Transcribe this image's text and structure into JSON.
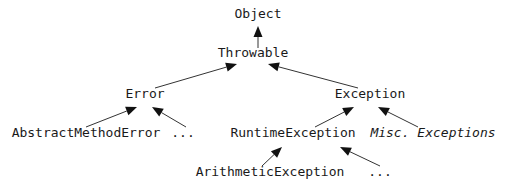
{
  "diagram": {
    "nodes": [
      {
        "id": "object",
        "label": "Object",
        "x": 258,
        "y": 18,
        "italic": false
      },
      {
        "id": "throwable",
        "label": "Throwable",
        "x": 253,
        "y": 57,
        "italic": false
      },
      {
        "id": "error",
        "label": "Error",
        "x": 145,
        "y": 98,
        "italic": false
      },
      {
        "id": "exception",
        "label": "Exception",
        "x": 370,
        "y": 98,
        "italic": false
      },
      {
        "id": "abstract_method_error",
        "label": "AbstractMethodError",
        "x": 86,
        "y": 137,
        "italic": false
      },
      {
        "id": "error_more",
        "label": "...",
        "x": 183,
        "y": 137,
        "italic": false
      },
      {
        "id": "runtime_exception",
        "label": "RuntimeException",
        "x": 293,
        "y": 137,
        "italic": false
      },
      {
        "id": "misc_exceptions",
        "label": "Misc. Exceptions",
        "x": 433,
        "y": 137,
        "italic": true
      },
      {
        "id": "arithmetic_exception",
        "label": "ArithmeticException",
        "x": 270,
        "y": 176,
        "italic": false
      },
      {
        "id": "runtime_more",
        "label": "...",
        "x": 380,
        "y": 176,
        "italic": false
      }
    ],
    "edges": [
      {
        "from": "throwable",
        "to": "object",
        "x1": 258,
        "y1": 48,
        "x2": 258,
        "y2": 26
      },
      {
        "from": "error",
        "to": "throwable",
        "x1": 155,
        "y1": 88,
        "x2": 237,
        "y2": 64
      },
      {
        "from": "exception",
        "to": "throwable",
        "x1": 358,
        "y1": 88,
        "x2": 268,
        "y2": 64
      },
      {
        "from": "abstract_method_error",
        "to": "error",
        "x1": 86,
        "y1": 127,
        "x2": 137,
        "y2": 107
      },
      {
        "from": "error_more",
        "to": "error",
        "x1": 186,
        "y1": 127,
        "x2": 152,
        "y2": 107
      },
      {
        "from": "runtime_exception",
        "to": "exception",
        "x1": 315,
        "y1": 127,
        "x2": 354,
        "y2": 107
      },
      {
        "from": "misc_exceptions",
        "to": "exception",
        "x1": 418,
        "y1": 127,
        "x2": 378,
        "y2": 107
      },
      {
        "from": "arithmetic_exception",
        "to": "runtime_exception",
        "x1": 262,
        "y1": 166,
        "x2": 282,
        "y2": 147
      },
      {
        "from": "runtime_more",
        "to": "runtime_exception",
        "x1": 380,
        "y1": 166,
        "x2": 340,
        "y2": 147
      }
    ]
  }
}
